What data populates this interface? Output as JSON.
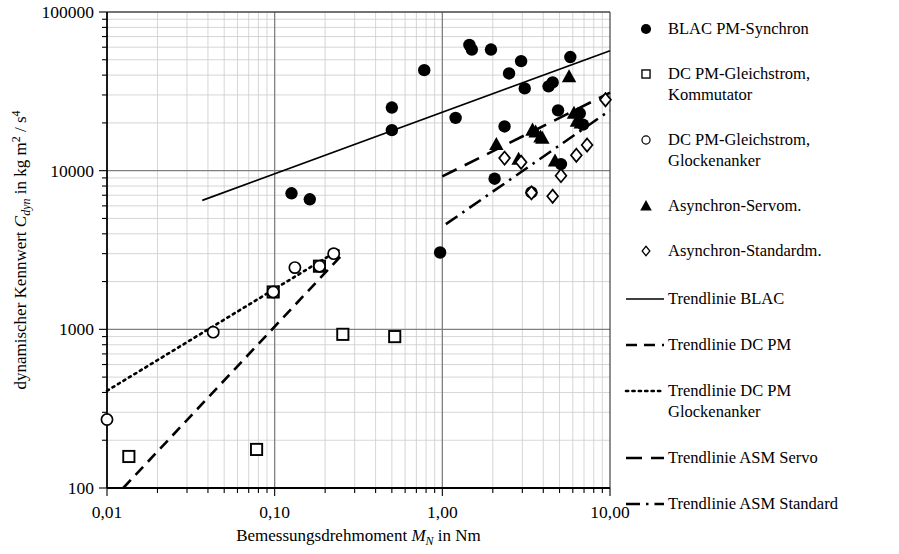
{
  "chart_data": {
    "type": "scatter",
    "title": "",
    "xlabel": "Bemessungsdrehmoment M_N in Nm",
    "ylabel": "dynamischer Kennwert C_dyn in kg m^2 / s^4",
    "xscale": "log",
    "yscale": "log",
    "xlim": [
      0.01,
      10.0
    ],
    "ylim": [
      100,
      100000
    ],
    "grid": true,
    "minor_grid": true,
    "legend_position": "right",
    "xticks": [
      0.01,
      0.1,
      1.0,
      10.0
    ],
    "xtick_labels": [
      "0,01",
      "0,10",
      "1,00",
      "10,00"
    ],
    "yticks": [
      100,
      1000,
      10000,
      100000
    ],
    "ytick_labels": [
      "100",
      "1000",
      "10000",
      "100000"
    ],
    "series": [
      {
        "name": "BLAC PM-Synchron",
        "marker": "filled-circle",
        "points": [
          [
            0.126,
            7200
          ],
          [
            0.162,
            6600
          ],
          [
            0.5,
            25000
          ],
          [
            0.5,
            18000
          ],
          [
            0.78,
            43000
          ],
          [
            0.97,
            3050
          ],
          [
            1.2,
            21500
          ],
          [
            1.45,
            62000
          ],
          [
            1.5,
            58000
          ],
          [
            1.95,
            58000
          ],
          [
            2.05,
            8900
          ],
          [
            2.35,
            19000
          ],
          [
            2.5,
            41000
          ],
          [
            2.95,
            49000
          ],
          [
            3.1,
            33000
          ],
          [
            3.4,
            7300
          ],
          [
            4.3,
            34000
          ],
          [
            4.55,
            36000
          ],
          [
            4.9,
            24000
          ],
          [
            5.1,
            11000
          ],
          [
            5.8,
            52000
          ],
          [
            6.6,
            23000
          ],
          [
            6.9,
            19500
          ]
        ]
      },
      {
        "name": "DC PM-Gleichstrom, Kommutator",
        "marker": "open-square",
        "points": [
          [
            0.0135,
            158
          ],
          [
            0.078,
            175
          ],
          [
            0.098,
            1720
          ],
          [
            0.185,
            2500
          ],
          [
            0.255,
            930
          ],
          [
            0.52,
            900
          ]
        ]
      },
      {
        "name": "DC PM-Gleichstrom, Glockenanker",
        "marker": "open-circle",
        "points": [
          [
            0.01,
            270
          ],
          [
            0.043,
            960
          ],
          [
            0.098,
            1720
          ],
          [
            0.132,
            2450
          ],
          [
            0.185,
            2500
          ],
          [
            0.225,
            3000
          ]
        ]
      },
      {
        "name": "Asynchron-Servom.",
        "marker": "filled-triangle",
        "points": [
          [
            2.1,
            14600
          ],
          [
            2.85,
            11800
          ],
          [
            3.45,
            18000
          ],
          [
            3.6,
            17500
          ],
          [
            3.85,
            16300
          ],
          [
            3.95,
            16000
          ],
          [
            4.7,
            11500
          ],
          [
            5.7,
            39000
          ],
          [
            6.1,
            23000
          ],
          [
            6.35,
            20500
          ],
          [
            6.7,
            20000
          ]
        ]
      },
      {
        "name": "Asynchron-Standardm.",
        "marker": "open-diamond",
        "points": [
          [
            2.35,
            12000
          ],
          [
            2.95,
            11300
          ],
          [
            3.4,
            7250
          ],
          [
            4.55,
            6900
          ],
          [
            5.1,
            9300
          ],
          [
            6.3,
            12500
          ],
          [
            7.3,
            14500
          ],
          [
            9.4,
            28000
          ]
        ]
      }
    ],
    "trendlines": [
      {
        "name": "Trendlinie BLAC",
        "style": "solid",
        "x0": 0.037,
        "y0": 6500,
        "x1": 10.0,
        "y1": 57000
      },
      {
        "name": "Trendlinie DC PM",
        "style": "dashed",
        "x0": 0.0125,
        "y0": 100,
        "x1": 0.26,
        "y1": 3050
      },
      {
        "name": "Trendlinie DC PM Glockenanker",
        "style": "dotted",
        "x0": 0.01,
        "y0": 410,
        "x1": 0.24,
        "y1": 3150
      },
      {
        "name": "Trendlinie ASM Servo",
        "style": "long-dashed",
        "x0": 1.0,
        "y0": 9200,
        "x1": 10.0,
        "y1": 31000
      },
      {
        "name": "Trendlinie ASM Standard",
        "style": "dash-dot",
        "x0": 1.05,
        "y0": 4600,
        "x1": 10.0,
        "y1": 24000
      }
    ]
  },
  "axes": {
    "xlabel_parts": {
      "pre": "Bemessungsdrehmoment ",
      "symbol": "M",
      "sub": "N",
      "post": " in Nm"
    },
    "ylabel_parts": {
      "pre": "dynamischer Kennwert ",
      "symbol": "C",
      "sub": "dyn",
      "post": " in kg m",
      "sup1": "2",
      "mid": " / s",
      "sup2": "4"
    }
  },
  "legend": {
    "markers": [
      {
        "id": "blac",
        "symbol": "filled-circle",
        "label": "BLAC PM-Synchron"
      },
      {
        "id": "dcpm",
        "symbol": "open-square",
        "label": "DC PM-Gleichstrom,",
        "label2": "Kommutator"
      },
      {
        "id": "dcpm-glocke",
        "symbol": "open-circle",
        "label": "DC PM-Gleichstrom,",
        "label2": "Glockenanker"
      },
      {
        "id": "asm-servo",
        "symbol": "filled-triangle",
        "label": "Asynchron-Servom."
      },
      {
        "id": "asm-std",
        "symbol": "open-diamond",
        "label": "Asynchron-Standardm."
      }
    ],
    "lines": [
      {
        "id": "tl-blac",
        "style": "solid",
        "label": "Trendlinie BLAC"
      },
      {
        "id": "tl-dcpm",
        "style": "dashed",
        "label": "Trendlinie DC PM"
      },
      {
        "id": "tl-dcpm-glocke",
        "style": "dotted",
        "label": "Trendlinie DC PM",
        "label2": "Glockenanker"
      },
      {
        "id": "tl-asm-servo",
        "style": "long-dashed",
        "label": "Trendlinie ASM Servo"
      },
      {
        "id": "tl-asm-std",
        "style": "dash-dot",
        "label": "Trendlinie ASM Standard"
      }
    ]
  },
  "style": {
    "ink": "#000000",
    "grid_major": "#808080",
    "grid_minor": "#cccccc",
    "background": "#ffffff"
  }
}
